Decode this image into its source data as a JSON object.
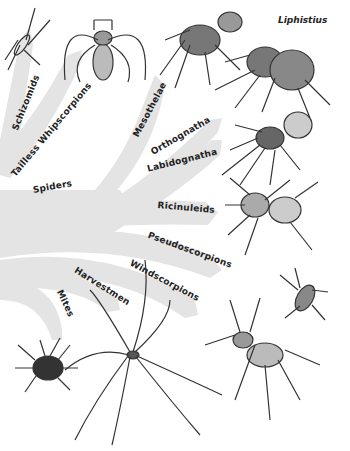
{
  "diagram": {
    "title_label": "Liphistius",
    "colors": {
      "branch": "#e4e4e4",
      "ink": "#333333",
      "background": "#ffffff"
    },
    "branches": [
      {
        "id": "schizomids",
        "label": "Schizomids"
      },
      {
        "id": "tailless-whipscorpions",
        "label": "Tailless Whipscorpions"
      },
      {
        "id": "mesothelae",
        "label": "Mesothelae"
      },
      {
        "id": "orthognatha",
        "label": "Orthognatha"
      },
      {
        "id": "labidognatha",
        "label": "Labidognatha"
      },
      {
        "id": "spiders",
        "label": "Spiders"
      },
      {
        "id": "ricinuleids",
        "label": "Ricinuleids"
      },
      {
        "id": "pseudoscorpions",
        "label": "Pseudoscorpions"
      },
      {
        "id": "windscorpions",
        "label": "Windscorpions"
      },
      {
        "id": "harvestmen",
        "label": "Harvestmen"
      },
      {
        "id": "mites",
        "label": "Mites"
      }
    ],
    "illustrations": [
      "schizomid",
      "tailless-whipscorpion",
      "mesothelae-spider",
      "liphistius",
      "orthognath-spider",
      "labidognath-spider",
      "ricinuleid",
      "pseudoscorpion",
      "windscorpion",
      "harvestman",
      "mite"
    ]
  }
}
